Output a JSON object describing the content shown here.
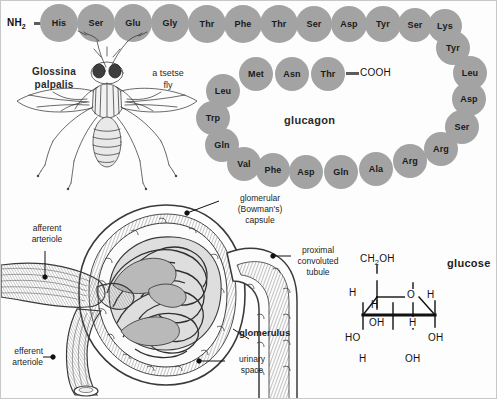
{
  "figure": {
    "background_color": "#fdfdfd",
    "bead_color": "#a3a3a3"
  },
  "glucagon": {
    "label": "glucagon",
    "n_terminus": "NH",
    "n_terminus_sub": "2",
    "c_terminus": "COOH",
    "residues": [
      {
        "name": "His",
        "x": 58,
        "y": 22,
        "r": 19
      },
      {
        "name": "Ser",
        "x": 95,
        "y": 22,
        "r": 19
      },
      {
        "name": "Glu",
        "x": 132,
        "y": 22,
        "r": 19
      },
      {
        "name": "Gly",
        "x": 169,
        "y": 22,
        "r": 19
      },
      {
        "name": "Thr",
        "x": 206,
        "y": 23,
        "r": 19
      },
      {
        "name": "Phe",
        "x": 242,
        "y": 23,
        "r": 19
      },
      {
        "name": "Thr",
        "x": 278,
        "y": 23,
        "r": 19
      },
      {
        "name": "Ser",
        "x": 313,
        "y": 23,
        "r": 18
      },
      {
        "name": "Asp",
        "x": 348,
        "y": 23,
        "r": 18
      },
      {
        "name": "Tyr",
        "x": 382,
        "y": 23,
        "r": 18
      },
      {
        "name": "Ser",
        "x": 414,
        "y": 24,
        "r": 17
      },
      {
        "name": "Lys",
        "x": 444,
        "y": 25,
        "r": 17
      },
      {
        "name": "Tyr",
        "x": 452,
        "y": 47,
        "r": 17
      },
      {
        "name": "Leu",
        "x": 469,
        "y": 72,
        "r": 17
      },
      {
        "name": "Asp",
        "x": 468,
        "y": 98,
        "r": 17
      },
      {
        "name": "Ser",
        "x": 461,
        "y": 126,
        "r": 17
      },
      {
        "name": "Arg",
        "x": 440,
        "y": 148,
        "r": 17
      },
      {
        "name": "Arg",
        "x": 409,
        "y": 160,
        "r": 17
      },
      {
        "name": "Ala",
        "x": 375,
        "y": 168,
        "r": 17
      },
      {
        "name": "Gln",
        "x": 340,
        "y": 171,
        "r": 17
      },
      {
        "name": "Asp",
        "x": 305,
        "y": 171,
        "r": 17
      },
      {
        "name": "Phe",
        "x": 272,
        "y": 169,
        "r": 17
      },
      {
        "name": "Val",
        "x": 243,
        "y": 163,
        "r": 17
      },
      {
        "name": "Gln",
        "x": 221,
        "y": 144,
        "r": 17
      },
      {
        "name": "Trp",
        "x": 212,
        "y": 117,
        "r": 17
      },
      {
        "name": "Leu",
        "x": 222,
        "y": 90,
        "r": 17
      },
      {
        "name": "Met",
        "x": 255,
        "y": 73,
        "r": 17
      },
      {
        "name": "Asn",
        "x": 291,
        "y": 73,
        "r": 17
      },
      {
        "name": "Thr",
        "x": 327,
        "y": 73,
        "r": 17
      }
    ]
  },
  "fly": {
    "scientific_name_line1": "Glossina",
    "scientific_name_line2": "palpalis",
    "common_name_line1": "a tsetse",
    "common_name_line2": "fly"
  },
  "glomerulus": {
    "annotations": [
      {
        "id": "glomerular-capsule",
        "line1": "glomerular",
        "line2": "(Bowman's)",
        "line3": "capsule",
        "bold": false
      },
      {
        "id": "afferent-arteriole",
        "line1": "afferent",
        "line2": "arteriole",
        "bold": false
      },
      {
        "id": "efferent-arteriole",
        "line1": "efferent",
        "line2": "arteriole",
        "bold": false
      },
      {
        "id": "proximal-convoluted-tubule",
        "line1": "proximal",
        "line2": "convoluted",
        "line3": "tubule",
        "bold": false
      },
      {
        "id": "glomerulus",
        "line1": "glomerulus",
        "bold": true
      },
      {
        "id": "urinary-space",
        "line1": "urinary",
        "line2": "space",
        "bold": false
      }
    ]
  },
  "glucose": {
    "title": "glucose",
    "atoms": {
      "ch2oh": "CH",
      "ch2oh_sub": "2",
      "ch2oh_tail": "OH",
      "h_top_left": "H",
      "h_inner_left": "H",
      "ring_o": "O",
      "h_top_right": "H",
      "oh_upper_left": "OH",
      "h_mid_right": "H",
      "ho_left": "HO",
      "oh_right": "OH",
      "h_bottom_left": "H",
      "oh_bottom": "OH"
    }
  }
}
